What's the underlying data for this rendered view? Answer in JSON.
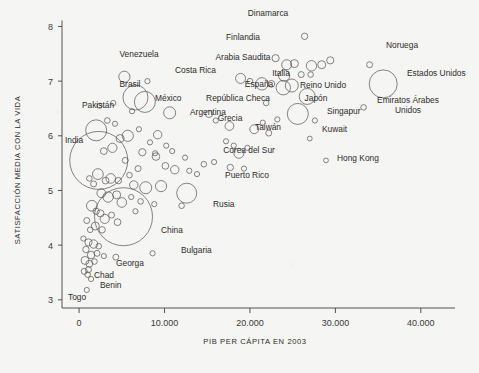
{
  "chart_data": {
    "type": "scatter",
    "title": "",
    "subtitle": "",
    "xlabel": "PIB PER CÁPITA EN 2003",
    "ylabel": "SATISFACCIÓN MEDIA CON LA VIDA",
    "xlim": [
      -2000,
      44000
    ],
    "ylim": [
      2.85,
      8.1
    ],
    "grid": false,
    "legend": null,
    "xticks": [
      0,
      10000,
      20000,
      30000,
      40000
    ],
    "xticklabels": [
      "0",
      "10.000",
      "20.000",
      "30.000",
      "40.000"
    ],
    "yticks": [
      3,
      4,
      5,
      6,
      7,
      8
    ],
    "yticklabels": [
      "3",
      "4",
      "5",
      "6",
      "7",
      "8"
    ],
    "marker": "open-circle",
    "size_encodes": "población",
    "labeled_points": [
      {
        "label": "Dinamarca",
        "x": 26400,
        "y": 7.82,
        "r": 3.2,
        "lx": 268,
        "ly": 16,
        "anchor": "middle"
      },
      {
        "label": "Finlandia",
        "x": 23000,
        "y": 7.42,
        "r": 3.6,
        "lx": 243,
        "ly": 40,
        "anchor": "middle"
      },
      {
        "label": "Noruega",
        "x": 34000,
        "y": 7.3,
        "r": 3.0,
        "lx": 402,
        "ly": 48,
        "anchor": "middle"
      },
      {
        "label": "Venezuela",
        "x": 5300,
        "y": 7.08,
        "r": 5.6,
        "lx": 139,
        "ly": 57,
        "anchor": "middle"
      },
      {
        "label": "Arabia Saudita",
        "x": 18900,
        "y": 7.05,
        "r": 5.0,
        "lx": 243,
        "ly": 60,
        "anchor": "middle"
      },
      {
        "label": "Costa Rica",
        "x": 8000,
        "y": 7.0,
        "r": 2.6,
        "lx": 175,
        "ly": 73,
        "anchor": "start"
      },
      {
        "label": "España",
        "x": 21400,
        "y": 6.95,
        "r": 6.2,
        "lx": 259,
        "ly": 87,
        "anchor": "middle"
      },
      {
        "label": "Italia",
        "x": 23900,
        "y": 6.88,
        "r": 7.2,
        "lx": 281,
        "ly": 76,
        "anchor": "middle"
      },
      {
        "label": "Estados Unidos",
        "x": 35600,
        "y": 6.95,
        "r": 14.0,
        "lx": 407,
        "ly": 76,
        "anchor": "start"
      },
      {
        "label": "Brasil",
        "x": 6600,
        "y": 6.7,
        "r": 12.5,
        "lx": 130,
        "ly": 87,
        "anchor": "middle"
      },
      {
        "label": "México",
        "x": 7700,
        "y": 6.62,
        "r": 10.5,
        "lx": 155,
        "ly": 101,
        "anchor": "start"
      },
      {
        "label": "Reino Unido",
        "x": 26700,
        "y": 6.72,
        "r": 8.0,
        "lx": 323,
        "ly": 88,
        "anchor": "middle"
      },
      {
        "label": "República Checa",
        "x": 15200,
        "y": 6.4,
        "r": 3.6,
        "lx": 238,
        "ly": 101,
        "anchor": "middle"
      },
      {
        "label": "Emiratos Árabes",
        "x": 33300,
        "y": 6.52,
        "r": 2.8,
        "lx": 408,
        "ly": 103,
        "anchor": "middle"
      },
      {
        "label": "Unidos",
        "x": null,
        "y": null,
        "r": 0,
        "lx": 408,
        "ly": 113,
        "anchor": "middle"
      },
      {
        "label": "Japón",
        "x": 25600,
        "y": 6.4,
        "r": 10.5,
        "lx": 316,
        "ly": 101,
        "anchor": "middle"
      },
      {
        "label": "Argentina",
        "x": 10600,
        "y": 6.42,
        "r": 6.0,
        "lx": 190,
        "ly": 115,
        "anchor": "start"
      },
      {
        "label": "Pakistán",
        "x": 2000,
        "y": 6.1,
        "r": 10.5,
        "lx": 98,
        "ly": 108,
        "anchor": "middle"
      },
      {
        "label": "Singapur",
        "x": 27600,
        "y": 6.28,
        "r": 2.6,
        "lx": 327,
        "ly": 114,
        "anchor": "start"
      },
      {
        "label": "Grecia",
        "x": 17600,
        "y": 6.18,
        "r": 4.4,
        "lx": 230,
        "ly": 121,
        "anchor": "middle"
      },
      {
        "label": "Taiwán",
        "x": 22200,
        "y": 6.05,
        "r": 3.0,
        "lx": 268,
        "ly": 130,
        "anchor": "middle"
      },
      {
        "label": "India",
        "x": 2300,
        "y": 5.55,
        "r": 29.0,
        "lx": 74,
        "ly": 143,
        "anchor": "middle"
      },
      {
        "label": "Kuwait",
        "x": 27000,
        "y": 5.95,
        "r": 2.4,
        "lx": 322,
        "ly": 132,
        "anchor": "start"
      },
      {
        "label": "Corea del Sur",
        "x": 18700,
        "y": 5.68,
        "r": 5.0,
        "lx": 249,
        "ly": 153,
        "anchor": "middle"
      },
      {
        "label": "Hong Kong",
        "x": 28900,
        "y": 5.55,
        "r": 2.4,
        "lx": 337,
        "ly": 161,
        "anchor": "start"
      },
      {
        "label": "Puerto Rico",
        "x": 17700,
        "y": 5.42,
        "r": 3.2,
        "lx": 247,
        "ly": 178,
        "anchor": "middle"
      },
      {
        "label": "Rusia",
        "x": 12600,
        "y": 4.95,
        "r": 10.0,
        "lx": 213,
        "ly": 207,
        "anchor": "start"
      },
      {
        "label": "China",
        "x": 5200,
        "y": 4.52,
        "r": 29.0,
        "lx": 161,
        "ly": 233,
        "anchor": "start"
      },
      {
        "label": "Bulgaria",
        "x": 8600,
        "y": 3.85,
        "r": 2.6,
        "lx": 181,
        "ly": 253,
        "anchor": "start"
      },
      {
        "label": "Georga",
        "x": 4300,
        "y": 3.78,
        "r": 3.0,
        "lx": 116,
        "ly": 266,
        "anchor": "start"
      },
      {
        "label": "Chad",
        "x": 1100,
        "y": 3.55,
        "r": 3.0,
        "lx": 94,
        "ly": 278,
        "anchor": "start"
      },
      {
        "label": "Benin",
        "x": 1400,
        "y": 3.38,
        "r": 2.6,
        "lx": 100,
        "ly": 288,
        "anchor": "start"
      },
      {
        "label": "Togo",
        "x": 900,
        "y": 3.18,
        "r": 2.6,
        "lx": 68,
        "ly": 300,
        "anchor": "start"
      }
    ],
    "unlabeled_points": [
      {
        "x": 24300,
        "y": 7.3,
        "r": 5.0
      },
      {
        "x": 25200,
        "y": 7.32,
        "r": 4.0
      },
      {
        "x": 27200,
        "y": 7.28,
        "r": 5.2
      },
      {
        "x": 28400,
        "y": 7.3,
        "r": 4.0
      },
      {
        "x": 29400,
        "y": 7.38,
        "r": 3.6
      },
      {
        "x": 24000,
        "y": 7.1,
        "r": 5.6
      },
      {
        "x": 26000,
        "y": 7.12,
        "r": 3.0
      },
      {
        "x": 27100,
        "y": 7.12,
        "r": 2.8
      },
      {
        "x": 24900,
        "y": 6.92,
        "r": 6.5
      },
      {
        "x": 22500,
        "y": 6.95,
        "r": 3.4
      },
      {
        "x": 20000,
        "y": 7.0,
        "r": 2.8
      },
      {
        "x": 21900,
        "y": 6.6,
        "r": 2.8
      },
      {
        "x": 16000,
        "y": 6.28,
        "r": 2.6
      },
      {
        "x": 20500,
        "y": 6.12,
        "r": 4.4
      },
      {
        "x": 21500,
        "y": 6.24,
        "r": 2.6
      },
      {
        "x": 18100,
        "y": 5.82,
        "r": 2.6
      },
      {
        "x": 19700,
        "y": 5.78,
        "r": 2.6
      },
      {
        "x": 14600,
        "y": 5.48,
        "r": 2.8
      },
      {
        "x": 12900,
        "y": 5.36,
        "r": 2.6
      },
      {
        "x": 13800,
        "y": 5.3,
        "r": 2.6
      },
      {
        "x": 11200,
        "y": 5.38,
        "r": 4.2
      },
      {
        "x": 10100,
        "y": 5.45,
        "r": 3.4
      },
      {
        "x": 9600,
        "y": 5.08,
        "r": 5.6
      },
      {
        "x": 12000,
        "y": 4.72,
        "r": 2.8
      },
      {
        "x": 8800,
        "y": 4.75,
        "r": 2.6
      },
      {
        "x": 9200,
        "y": 6.02,
        "r": 4.2
      },
      {
        "x": 10200,
        "y": 5.82,
        "r": 2.6
      },
      {
        "x": 10900,
        "y": 5.72,
        "r": 2.6
      },
      {
        "x": 9000,
        "y": 5.62,
        "r": 3.8
      },
      {
        "x": 8300,
        "y": 5.88,
        "r": 2.6
      },
      {
        "x": 7400,
        "y": 5.7,
        "r": 3.6
      },
      {
        "x": 6900,
        "y": 5.4,
        "r": 3.0
      },
      {
        "x": 6400,
        "y": 5.1,
        "r": 4.2
      },
      {
        "x": 7800,
        "y": 5.05,
        "r": 6.0
      },
      {
        "x": 5700,
        "y": 6.0,
        "r": 5.6
      },
      {
        "x": 4800,
        "y": 5.95,
        "r": 4.0
      },
      {
        "x": 4200,
        "y": 6.22,
        "r": 2.6
      },
      {
        "x": 3300,
        "y": 6.28,
        "r": 2.8
      },
      {
        "x": 3900,
        "y": 5.78,
        "r": 4.6
      },
      {
        "x": 2900,
        "y": 5.72,
        "r": 3.4
      },
      {
        "x": 2200,
        "y": 5.3,
        "r": 5.4
      },
      {
        "x": 3100,
        "y": 5.18,
        "r": 3.4
      },
      {
        "x": 3700,
        "y": 5.22,
        "r": 4.8
      },
      {
        "x": 4600,
        "y": 5.18,
        "r": 3.2
      },
      {
        "x": 1700,
        "y": 5.12,
        "r": 3.0
      },
      {
        "x": 1200,
        "y": 5.22,
        "r": 2.8
      },
      {
        "x": 2600,
        "y": 4.95,
        "r": 4.4
      },
      {
        "x": 3400,
        "y": 4.88,
        "r": 5.2
      },
      {
        "x": 4400,
        "y": 4.92,
        "r": 4.0
      },
      {
        "x": 5000,
        "y": 4.78,
        "r": 4.8
      },
      {
        "x": 1500,
        "y": 4.72,
        "r": 5.4
      },
      {
        "x": 2000,
        "y": 4.62,
        "r": 3.2
      },
      {
        "x": 2500,
        "y": 4.58,
        "r": 3.6
      },
      {
        "x": 3000,
        "y": 4.48,
        "r": 4.6
      },
      {
        "x": 3800,
        "y": 4.55,
        "r": 3.0
      },
      {
        "x": 4500,
        "y": 4.42,
        "r": 3.4
      },
      {
        "x": 1900,
        "y": 4.35,
        "r": 4.0
      },
      {
        "x": 2700,
        "y": 4.28,
        "r": 3.2
      },
      {
        "x": 1300,
        "y": 4.28,
        "r": 2.8
      },
      {
        "x": 900,
        "y": 4.45,
        "r": 3.0
      },
      {
        "x": 1100,
        "y": 4.05,
        "r": 3.6
      },
      {
        "x": 1700,
        "y": 4.02,
        "r": 4.2
      },
      {
        "x": 2300,
        "y": 3.98,
        "r": 2.8
      },
      {
        "x": 800,
        "y": 3.92,
        "r": 3.2
      },
      {
        "x": 1400,
        "y": 3.82,
        "r": 3.8
      },
      {
        "x": 2100,
        "y": 3.85,
        "r": 3.0
      },
      {
        "x": 2900,
        "y": 3.8,
        "r": 2.6
      },
      {
        "x": 700,
        "y": 3.72,
        "r": 4.0
      },
      {
        "x": 1200,
        "y": 3.66,
        "r": 3.4
      },
      {
        "x": 1800,
        "y": 3.7,
        "r": 2.8
      },
      {
        "x": 600,
        "y": 3.52,
        "r": 3.0
      },
      {
        "x": 1000,
        "y": 3.46,
        "r": 2.8
      },
      {
        "x": 500,
        "y": 4.12,
        "r": 2.6
      },
      {
        "x": 6100,
        "y": 4.88,
        "r": 2.6
      },
      {
        "x": 6600,
        "y": 4.62,
        "r": 2.6
      },
      {
        "x": 7200,
        "y": 4.8,
        "r": 2.8
      },
      {
        "x": 5400,
        "y": 5.55,
        "r": 3.0
      },
      {
        "x": 5900,
        "y": 5.28,
        "r": 2.8
      },
      {
        "x": 8900,
        "y": 5.68,
        "r": 2.6
      },
      {
        "x": 7000,
        "y": 6.12,
        "r": 2.6
      },
      {
        "x": 6200,
        "y": 6.45,
        "r": 2.6
      },
      {
        "x": 12400,
        "y": 5.6,
        "r": 2.6
      },
      {
        "x": 15800,
        "y": 5.52,
        "r": 2.6
      },
      {
        "x": 17200,
        "y": 5.9,
        "r": 2.6
      },
      {
        "x": 19300,
        "y": 5.4,
        "r": 2.6
      },
      {
        "x": 23200,
        "y": 6.3,
        "r": 2.6
      },
      {
        "x": 4000,
        "y": 6.6,
        "r": 2.6
      },
      {
        "x": 2400,
        "y": 6.55,
        "r": 2.6
      }
    ]
  }
}
